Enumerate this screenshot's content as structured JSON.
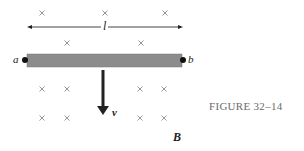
{
  "figure": {
    "caption": "FIGURE 32–14",
    "labels": {
      "left_end": "a",
      "right_end": "b",
      "length": "l",
      "velocity": "v",
      "field": "B"
    },
    "field_symbol": "×",
    "field_direction": "into page",
    "colors": {
      "rod": "#8c8c8c",
      "ink": "#222222",
      "cross": "#8a8a8a",
      "caption": "#6a6a6a"
    },
    "crosses": [
      {
        "x": 42,
        "y": 13
      },
      {
        "x": 105,
        "y": 13
      },
      {
        "x": 165,
        "y": 13
      },
      {
        "x": 67,
        "y": 43
      },
      {
        "x": 141,
        "y": 43
      },
      {
        "x": 42,
        "y": 89
      },
      {
        "x": 67,
        "y": 89
      },
      {
        "x": 140,
        "y": 89
      },
      {
        "x": 164,
        "y": 89
      },
      {
        "x": 42,
        "y": 118
      },
      {
        "x": 67,
        "y": 118
      },
      {
        "x": 140,
        "y": 118
      },
      {
        "x": 164,
        "y": 118
      }
    ]
  }
}
